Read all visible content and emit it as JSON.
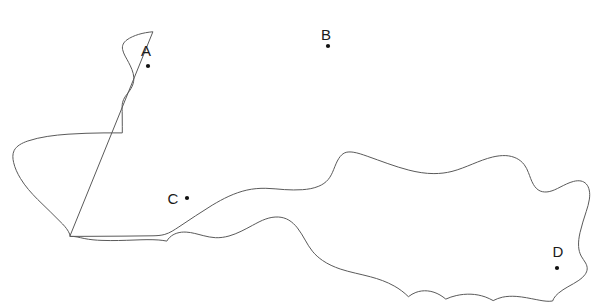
{
  "figure": {
    "name": "region-outline-map",
    "type": "line-drawing-map",
    "background_color": "#ffffff",
    "outline_color": "#5a5a5a",
    "marker_color": "#111111",
    "label_color": "#1a1a1a",
    "width": 594,
    "height": 307
  },
  "sites": [
    {
      "id": "A",
      "label": "A",
      "label_x": 146,
      "label_y": 56,
      "dot_x": 148,
      "dot_y": 66,
      "dot_r": 2.1
    },
    {
      "id": "B",
      "label": "B",
      "label_x": 326,
      "label_y": 40,
      "dot_x": 328,
      "dot_y": 46,
      "dot_r": 2.1
    },
    {
      "id": "C",
      "label": "C",
      "label_x": 173,
      "label_y": 204,
      "dot_x": 187,
      "dot_y": 198,
      "dot_r": 2.1
    },
    {
      "id": "D",
      "label": "D",
      "label_x": 558,
      "label_y": 257,
      "dot_x": 557,
      "dot_y": 268,
      "dot_r": 2.1
    }
  ],
  "outline": {
    "name": "region-boundary",
    "closed": true,
    "path": "M 152.5 31.8 C 143.0 32.6 133.5 35.2 127.0 39.8 C 123.5 42.3 121.8 45.6 122.6 49.5 C 123.6 54.2 126.4 58.1 128.6 62.4 C 131.0 67.0 133.4 72.0 133.8 77.3 C 134.2 82.8 132.0 87.6 128.8 91.8 C 126.3 95.1 123.6 98.2 122.6 102.3 C 121.9 105.3 122.1 108.5 122.2 111.6 C 122.3 116.5 122.3 121.4 122.3 126.3 L 122.3 132.9 L 104.0 132.9 C 92.0 133.0 80.0 133.4 68.0 134.2 C 54.0 135.2 40.0 136.9 27.8 141.0 C 22.0 143.0 16.6 145.8 14.2 150.4 C 12.3 154.1 12.7 158.5 13.6 162.4 C 14.9 168.2 17.5 173.5 20.5 178.5 C 25.2 186.3 31.3 193.0 37.6 199.4 C 45.8 207.7 54.6 215.5 62.6 224.0 C 65.4 227.0 68.1 230.2 69.6 234.0 C 69.9 234.8 70.1 235.6 70.2 236.4 L 93.0 236.3 C 113.0 236.2 133.0 236.1 153.0 235.8 C 157.0 235.7 161.0 235.5 164.8 234.4 C 170.0 232.9 174.4 229.8 178.9 226.9 C 190.0 219.7 200.8 212.0 212.2 205.2 C 223.0 198.7 234.4 192.9 246.8 190.1 C 253.0 188.7 259.4 188.2 265.8 188.3 C 272.0 188.4 278.2 189.2 284.4 189.6 C 290.4 190.0 296.4 190.1 302.4 189.7 C 308.0 189.3 313.6 188.4 318.8 186.2 C 322.4 184.7 325.7 182.5 328.2 179.5 C 330.6 176.6 332.2 173.2 333.6 169.7 C 335.2 165.8 336.6 161.8 338.9 158.3 C 340.4 156.0 342.3 153.9 344.8 152.8 C 347.4 151.7 350.4 151.8 353.2 152.2 C 358.0 152.9 362.6 154.6 367.2 156.2 C 381.0 161.0 394.6 166.5 408.8 170.1 C 417.0 172.2 425.4 173.6 433.9 173.6 C 440.0 173.6 446.1 172.9 452.0 171.4 C 459.0 169.6 465.7 166.8 472.4 164.1 C 479.0 161.4 485.7 158.7 492.7 157.0 C 497.0 156.0 501.4 155.4 505.8 155.6 C 509.6 155.8 513.3 156.7 516.7 158.4 C 519.6 159.9 522.2 162.0 524.2 164.6 C 526.0 167.0 527.3 169.7 528.4 172.5 C 530.0 176.5 531.2 180.7 533.4 184.4 C 535.0 187.2 537.2 189.7 540.2 191.0 C 543.0 192.2 546.2 192.2 549.2 191.6 C 553.0 190.8 556.5 189.0 560.0 187.2 C 564.4 185.0 568.8 182.6 573.6 181.4 C 576.0 180.8 578.6 180.5 581.0 181.0 C 583.0 181.4 584.8 182.4 586.2 183.9 C 587.8 185.6 588.7 187.8 589.2 190.0 C 589.9 193.0 589.8 196.1 589.4 199.1 C 588.8 203.4 587.5 207.5 586.2 211.6 C 584.0 218.6 581.6 225.5 580.0 232.7 C 579.0 237.2 578.3 241.8 578.6 246.4 C 578.8 249.8 579.6 253.1 581.2 256.1 C 582.5 258.5 584.3 260.6 585.6 263.0 C 586.6 264.8 587.3 266.8 587.2 268.9 C 587.1 271.0 586.2 272.9 585.0 274.6 C 583.4 276.9 581.2 278.7 578.9 280.3 C 575.4 282.7 571.6 284.7 567.9 286.8 C 564.6 288.7 561.3 290.7 558.4 293.2 C 556.6 294.7 555.0 296.4 553.8 298.4 C 553.3 299.2 552.9 300.1 552.6 301.0 C 551.5 301.2 550.4 301.3 549.2 301.3 C 545.0 301.3 540.9 300.5 536.8 299.7 C 530.0 298.4 523.2 296.9 516.2 296.4 C 511.6 296.1 506.9 296.2 502.4 297.2 C 499.2 297.9 496.1 299.1 493.2 300.6 C 490.6 299.2 488.0 297.9 485.2 296.9 C 480.6 295.3 475.8 294.4 471.0 294.2 C 466.0 294.0 461.0 294.5 456.2 295.6 C 452.6 296.4 449.1 297.6 445.8 299.1 C 444.0 297.6 442.1 296.2 440.0 295.0 C 436.2 292.8 432.0 291.3 427.6 290.9 C 423.6 290.5 419.6 291.0 415.9 292.4 C 413.2 293.4 410.7 294.9 408.4 296.7 C 404.2 292.5 399.4 288.9 394.2 286.0 C 386.8 281.8 378.7 279.0 370.5 276.8 C 360.4 274.1 350.1 272.3 340.2 269.0 C 334.0 266.9 328.0 264.2 322.6 260.5 C 318.8 257.9 315.3 254.8 312.4 251.2 C 309.6 247.8 307.4 243.9 305.2 240.1 C 302.8 235.9 300.4 231.7 297.4 227.9 C 295.0 224.9 292.2 222.1 288.8 220.1 C 285.6 218.2 282.0 217.2 278.3 217.0 C 274.0 216.8 269.8 217.6 265.8 219.0 C 261.2 220.6 256.9 223.0 252.6 225.3 C 245.0 229.4 237.4 233.6 229.0 236.0 C 224.6 237.2 220.0 237.9 215.4 237.7 C 211.2 237.5 207.2 236.6 203.2 235.6 C 197.6 234.2 192.0 232.4 186.2 232.1 C 183.0 231.9 179.8 232.2 176.8 233.2 C 174.2 234.0 171.8 235.4 169.8 237.3 C 168.6 238.4 167.6 239.7 166.8 241.1 C 164.2 240.6 161.6 240.2 158.9 240.0 C 151.0 239.4 143.0 239.7 135.0 240.0 C 124.0 240.4 113.0 240.8 102.0 240.4 C 96.0 240.2 90.0 239.7 84.2 238.5 C 79.4 237.5 74.7 236.1 70.2 236.4 L 70.2 236.4 Z"
  }
}
